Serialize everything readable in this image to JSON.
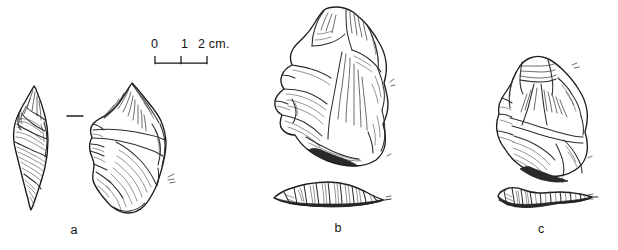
{
  "plate": {
    "title": "Lithic artefact plate",
    "background_color": "#ffffff",
    "ink_color": "#1c1c1c",
    "width": 618,
    "height": 250
  },
  "scale_bar": {
    "name": "scale-bar",
    "unit": "cm.",
    "tick_labels": [
      "0",
      "1",
      "2 cm."
    ],
    "tick_values": [
      0,
      1,
      2
    ],
    "length_px": 52,
    "minor_tick_label": "1"
  },
  "figures": [
    {
      "id": "a",
      "caption": "a",
      "views": [
        "profile/side view",
        "dorsal/face view"
      ],
      "description": "Narrow elongated flake shown in side view beside a broader faced view",
      "has_section": false,
      "has_tick_mark": true
    },
    {
      "id": "b",
      "caption": "b",
      "views": [
        "face view",
        "transverse section"
      ],
      "description": "Large thick core/biface with flake scars and a low wide cross-section below",
      "has_section": true,
      "has_tick_mark": false
    },
    {
      "id": "c",
      "caption": "c",
      "views": [
        "face view",
        "transverse section"
      ],
      "description": "Sub-triangular core with flake scars and an elongated tapering cross-section below",
      "has_section": true,
      "has_tick_mark": false
    }
  ]
}
